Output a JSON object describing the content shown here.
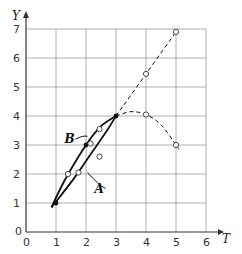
{
  "chart_data": {
    "type": "line",
    "title": "",
    "xlabel": "T",
    "ylabel": "Y",
    "xlim": [
      0,
      6
    ],
    "ylim": [
      0,
      7
    ],
    "xticks": [
      "0",
      "1",
      "2",
      "3",
      "4",
      "5",
      "6"
    ],
    "yticks": [
      "0",
      "1",
      "2",
      "3",
      "4",
      "5",
      "6",
      "7"
    ],
    "grid": true,
    "series": [
      {
        "name": "B",
        "style": "solid",
        "points": [
          [
            0.85,
            0.85
          ],
          [
            1.3,
            1.8
          ],
          [
            2.0,
            3.0
          ],
          [
            2.5,
            3.65
          ],
          [
            3.0,
            4.0
          ]
        ]
      },
      {
        "name": "A",
        "style": "solid",
        "points": [
          [
            0.85,
            0.85
          ],
          [
            1.6,
            1.85
          ],
          [
            2.2,
            2.75
          ],
          [
            2.7,
            3.5
          ],
          [
            3.0,
            4.0
          ]
        ]
      },
      {
        "name": "linear-extension",
        "style": "dashed",
        "points": [
          [
            3.0,
            4.0
          ],
          [
            4.0,
            5.45
          ],
          [
            5.0,
            6.9
          ]
        ]
      },
      {
        "name": "curved-extension",
        "style": "dashed",
        "points": [
          [
            3.0,
            4.0
          ],
          [
            3.5,
            4.15
          ],
          [
            4.0,
            4.05
          ],
          [
            4.5,
            3.7
          ],
          [
            5.0,
            3.0
          ],
          [
            5.1,
            2.85
          ]
        ]
      }
    ],
    "markers": {
      "filled": [
        [
          1.0,
          1.0
        ],
        [
          2.0,
          3.0
        ],
        [
          3.0,
          4.0
        ]
      ],
      "open": [
        [
          1.4,
          2.0
        ],
        [
          1.75,
          2.05
        ],
        [
          2.15,
          3.05
        ],
        [
          2.45,
          3.55
        ],
        [
          2.45,
          2.6
        ],
        [
          4.0,
          5.45
        ],
        [
          5.0,
          6.9
        ],
        [
          4.0,
          4.05
        ],
        [
          5.0,
          3.0
        ]
      ]
    },
    "annotations": [
      {
        "text": "B",
        "at": [
          1.75,
          3.2
        ],
        "arrow_to": [
          2.05,
          3.3
        ]
      },
      {
        "text": "A",
        "at": [
          2.75,
          1.5
        ],
        "arrow_to": [
          2.05,
          2.05
        ]
      }
    ]
  }
}
